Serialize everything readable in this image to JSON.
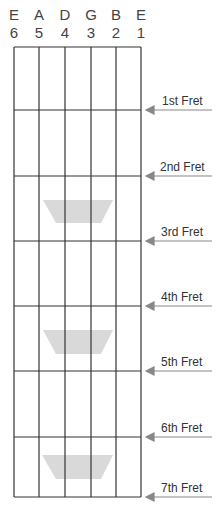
{
  "strings": [
    {
      "note": "E",
      "number": "6"
    },
    {
      "note": "A",
      "number": "5"
    },
    {
      "note": "D",
      "number": "4"
    },
    {
      "note": "G",
      "number": "3"
    },
    {
      "note": "B",
      "number": "2"
    },
    {
      "note": "E",
      "number": "1"
    }
  ],
  "frets": [
    {
      "label": "1st Fret"
    },
    {
      "label": "2nd Fret"
    },
    {
      "label": "3rd Fret"
    },
    {
      "label": "4th Fret"
    },
    {
      "label": "5th Fret"
    },
    {
      "label": "6th Fret"
    },
    {
      "label": "7th Fret"
    }
  ],
  "markers": [
    {
      "between_frets": "2-3",
      "shape": "trapezoid"
    },
    {
      "between_frets": "4-5",
      "shape": "trapezoid"
    },
    {
      "between_frets": "6-7",
      "shape": "trapezoid"
    }
  ],
  "colors": {
    "grid": "#333333",
    "marker": "#d9d9d9",
    "arrow": "#888888"
  }
}
